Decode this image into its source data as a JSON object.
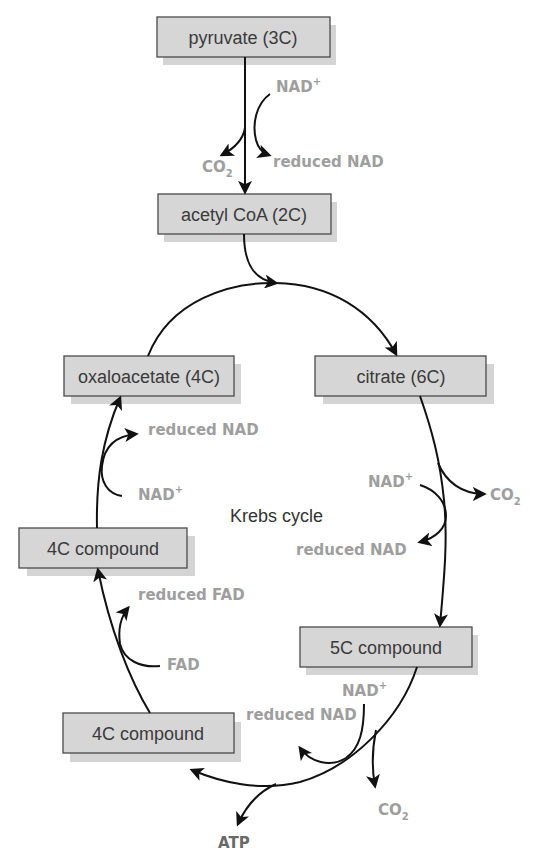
{
  "diagram": {
    "title": "Krebs cycle",
    "boxes": {
      "pyruvate": "pyruvate (3C)",
      "acetyl_coa": "acetyl CoA (2C)",
      "citrate": "citrate (6C)",
      "oxaloacetate": "oxaloacetate (4C)",
      "compound_4c_upper": "4C compound",
      "compound_5c": "5C compound",
      "compound_4c_lower": "4C compound"
    },
    "labels": {
      "link_nad_in": "NAD",
      "link_nad_sup": "+",
      "link_co2": "CO",
      "link_co2_sub": "2",
      "link_reduced_nad": "reduced NAD",
      "citrate_nad_in": "NAD",
      "citrate_nad_sup": "+",
      "citrate_co2": "CO",
      "citrate_co2_sub": "2",
      "citrate_reduced_nad": "reduced NAD",
      "c5_nad_in": "NAD",
      "c5_nad_sup": "+",
      "c5_reduced_nad": "reduced NAD",
      "c5_co2": "CO",
      "c5_co2_sub": "2",
      "c5_atp": "ATP",
      "fad_in": "FAD",
      "reduced_fad": "reduced FAD",
      "oxa_nad_in": "NAD",
      "oxa_nad_sup": "+",
      "oxa_reduced_nad": "reduced NAD"
    },
    "colors": {
      "box_fill": "#d6d6d6",
      "box_stroke": "#4a4a4a",
      "label_gray": "#9e9e9e",
      "arrow": "#111111"
    }
  }
}
